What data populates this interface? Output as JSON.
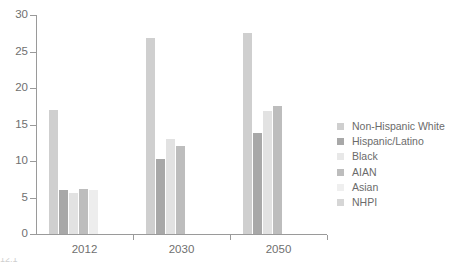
{
  "chart_data": {
    "type": "bar",
    "title": "",
    "subtitle": "",
    "xlabel": "",
    "ylabel": "",
    "grid": false,
    "legend_position": "right",
    "categories": [
      "2012",
      "2030",
      "2050"
    ],
    "ylim": [
      0,
      30
    ],
    "yticks": [
      0,
      5,
      10,
      15,
      20,
      25,
      30
    ],
    "ytick_labels": [
      "0",
      "5",
      "10",
      "15",
      "20",
      "25",
      "30"
    ],
    "series": [
      {
        "name": "Non-Hispanic White",
        "color": "#cfcfcf",
        "values": [
          17.0,
          26.8,
          27.5
        ]
      },
      {
        "name": "Hispanic/Latino",
        "color": "#a8a8a8",
        "values": [
          6.0,
          10.3,
          13.8
        ]
      },
      {
        "name": "Black",
        "color": "#e2e2e2",
        "values": [
          5.6,
          13.0,
          16.8
        ]
      },
      {
        "name": "AIAN",
        "color": "#bdbdbd",
        "values": [
          6.1,
          12.0,
          17.5
        ]
      },
      {
        "name": "Asian",
        "color": "#ededed",
        "values": [
          6.0,
          0.0,
          0.0
        ]
      },
      {
        "name": "NHPI",
        "color": "#d6d6d6",
        "values": [
          0.0,
          0.0,
          0.0
        ]
      }
    ]
  },
  "legend": {
    "items": [
      {
        "label": "Non-Hispanic White",
        "color": "#cfcfcf"
      },
      {
        "label": "Hispanic/Latino",
        "color": "#a8a8a8"
      },
      {
        "label": "Black",
        "color": "#e8e8e8"
      },
      {
        "label": "AIAN",
        "color": "#bdbdbd"
      },
      {
        "label": "Asian",
        "color": "#efefef"
      },
      {
        "label": "NHPI",
        "color": "#d6d6d6"
      }
    ]
  },
  "axes": {
    "y_tick_labels": [
      "30",
      "25",
      "20",
      "15",
      "10",
      "5",
      "0"
    ],
    "x_group_labels": [
      "2012",
      "2030",
      "2050"
    ]
  },
  "artifact": {
    "bottom_text": "12.1"
  }
}
